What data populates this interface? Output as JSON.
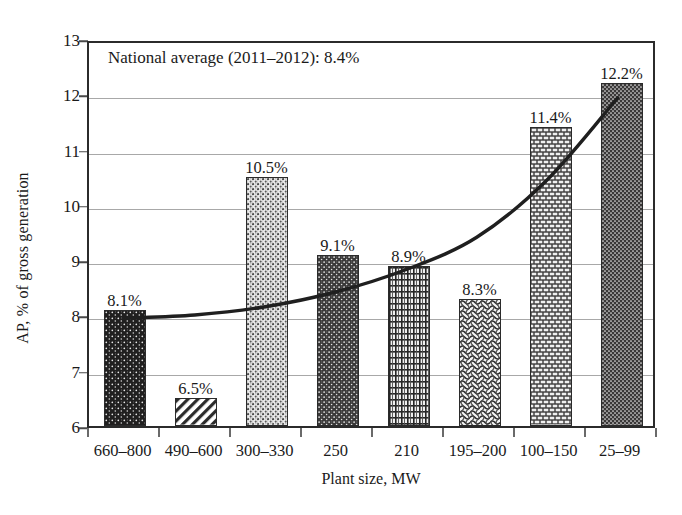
{
  "chart_data": {
    "type": "bar",
    "title": "",
    "xlabel": "Plant size, MW",
    "ylabel": "AP, % of gross generation",
    "categories": [
      "660–800",
      "490–600",
      "300–330",
      "250",
      "210",
      "195–200",
      "100–150",
      "25–99"
    ],
    "values": [
      8.1,
      6.5,
      10.5,
      9.1,
      8.9,
      8.3,
      11.4,
      12.2
    ],
    "value_labels": [
      "8.1%",
      "6.5%",
      "10.5%",
      "9.1%",
      "8.9%",
      "8.3%",
      "11.4%",
      "12.2%"
    ],
    "ylim": [
      6,
      13
    ],
    "yticks": [
      6,
      7,
      8,
      9,
      10,
      11,
      12,
      13
    ],
    "ytick_labels": [
      "6",
      "7",
      "8",
      "9",
      "10",
      "11",
      "12",
      "13"
    ],
    "grid": "horizontal",
    "legend": "none",
    "annotations": [
      {
        "text": "National average (2011–2012): 8.4%",
        "value": 8.4
      }
    ],
    "series": [
      {
        "name": "AP, % of gross generation",
        "type": "bar",
        "values": [
          8.1,
          6.5,
          10.5,
          9.1,
          8.9,
          8.3,
          11.4,
          12.2
        ],
        "fill_patterns": [
          "dark-speckle",
          "diagonal-hatch",
          "light-speckle",
          "mid-speckle",
          "grid-crosshatch",
          "basket-weave",
          "brick",
          "dark-dot"
        ]
      },
      {
        "name": "trend",
        "type": "line",
        "description": "smooth increasing trend curve",
        "points": [
          {
            "x": 0,
            "y": 7.97
          },
          {
            "x": 1,
            "y": 8.03
          },
          {
            "x": 2,
            "y": 8.18
          },
          {
            "x": 3,
            "y": 8.45
          },
          {
            "x": 4,
            "y": 8.86
          },
          {
            "x": 5,
            "y": 9.45
          },
          {
            "x": 6,
            "y": 10.5
          },
          {
            "x": 7,
            "y": 12.0
          }
        ]
      }
    ]
  },
  "colors": {
    "axis": "#2b2b2b",
    "grid": "#a8a8a8",
    "text": "#1a1a1a",
    "trend": "#1f1f1f",
    "background": "#ffffff"
  }
}
